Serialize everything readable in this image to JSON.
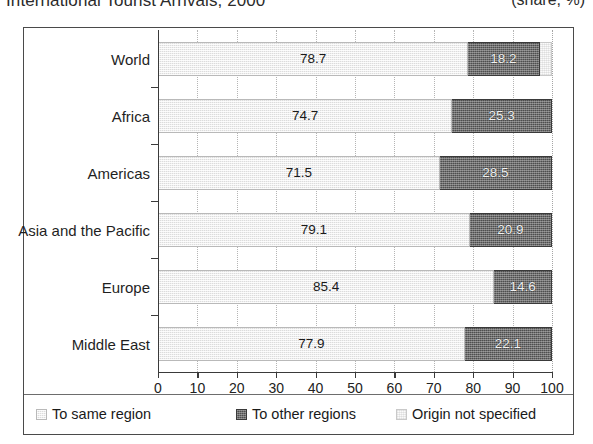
{
  "header": {
    "title": "International Tourist Arrivals, 2000",
    "units": "(share, %)"
  },
  "legend": {
    "position": "bottom",
    "items": [
      {
        "label": "To same region",
        "key": "same",
        "color": "#dcdcdc"
      },
      {
        "label": "To other regions",
        "key": "other",
        "color": "#4e4e4e"
      },
      {
        "label": "Origin not specified",
        "key": "unspec",
        "color": "#fbfbfb"
      }
    ]
  },
  "axis": {
    "x_ticks": [
      "0",
      "10",
      "20",
      "30",
      "40",
      "50",
      "60",
      "70",
      "80",
      "90",
      "100"
    ]
  },
  "chart_data": {
    "type": "bar",
    "orientation": "horizontal",
    "stacked": true,
    "title": "International Tourist Arrivals, 2000",
    "subtitle": "(share, %)",
    "xlabel": "",
    "ylabel": "",
    "xlim": [
      0,
      100
    ],
    "xticks": [
      0,
      10,
      20,
      30,
      40,
      50,
      60,
      70,
      80,
      90,
      100
    ],
    "grid": "vertical-dotted",
    "legend_position": "bottom",
    "categories": [
      "World",
      "Africa",
      "Americas",
      "Asia and the Pacific",
      "Europe",
      "Middle East"
    ],
    "series": [
      {
        "name": "To same region",
        "values": [
          78.7,
          74.7,
          71.5,
          79.1,
          85.4,
          77.9
        ]
      },
      {
        "name": "To other regions",
        "values": [
          18.2,
          25.3,
          28.5,
          20.9,
          14.6,
          22.1
        ]
      },
      {
        "name": "Origin not specified",
        "values": [
          3.1,
          0.0,
          0.0,
          0.0,
          0.0,
          0.0
        ]
      }
    ],
    "data_labels": {
      "World": [
        "78.7",
        "18.2",
        ""
      ],
      "Africa": [
        "74.7",
        "25.3",
        ""
      ],
      "Americas": [
        "71.5",
        "28.5",
        ""
      ],
      "Asia and the Pacific": [
        "79.1",
        "20.9",
        ""
      ],
      "Europe": [
        "85.4",
        "14.6",
        ""
      ],
      "Middle East": [
        "77.9",
        "22.1",
        ""
      ]
    }
  }
}
